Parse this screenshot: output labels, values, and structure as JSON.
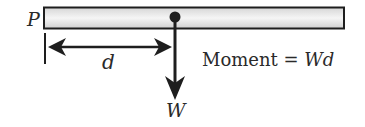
{
  "diagram": {
    "type": "moment-of-force",
    "labels": {
      "pivot": "P",
      "distance": "d",
      "force": "W",
      "equation_word": "Moment",
      "equation_eq": " = ",
      "equation_rhs": "Wd"
    },
    "colors": {
      "stroke": "#1e1e1e",
      "beam_fill_light": "#f4f4f4",
      "beam_fill_dark": "#d8d8d8",
      "text": "#2a2a2a"
    },
    "geometry": {
      "beam": {
        "x": 44,
        "y": 7,
        "width": 300,
        "height": 22
      },
      "load_point": {
        "x": 175,
        "y": 17,
        "r": 5
      },
      "force_arrow": {
        "x": 175,
        "y_start": 17,
        "y_tip": 99
      },
      "distance_arrow": {
        "y": 47,
        "x_start": 48,
        "x_end": 172
      },
      "pivot_tick": {
        "x": 45,
        "y_start": 33,
        "y_end": 64
      }
    }
  }
}
